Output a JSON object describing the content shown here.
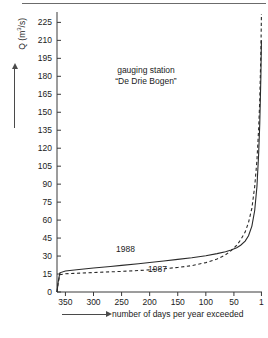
{
  "annotation": {
    "line1": "gauging station",
    "line2": "“De Drie Bogen”"
  },
  "axes": {
    "y_title_prefix": "Q (m",
    "y_title_exp": "3",
    "y_title_suffix": "/s)",
    "x_caption": "number of days per year exceeded"
  },
  "chart_data": {
    "type": "line",
    "title": "",
    "subtitle": "",
    "xlabel": "number of days per year exceeded",
    "ylabel": "Q (m3/s)",
    "xlim": [
      365,
      0
    ],
    "ylim": [
      0,
      232
    ],
    "x_ticks": [
      350,
      300,
      250,
      200,
      150,
      100,
      50,
      1
    ],
    "y_ticks": [
      0,
      15,
      30,
      45,
      60,
      75,
      90,
      105,
      120,
      135,
      150,
      165,
      180,
      195,
      210,
      225
    ],
    "x_reversed": true,
    "grid": false,
    "legend": "inline-labels",
    "annotations": [
      {
        "text": "gauging station",
        "x": 200,
        "y": 190
      },
      {
        "text": "“De Drie Bogen”",
        "x": 200,
        "y": 182
      },
      {
        "text": "1988",
        "x": 175,
        "y": 37
      },
      {
        "text": "1987",
        "x": 130,
        "y": 22
      }
    ],
    "series": [
      {
        "name": "1988",
        "style": "solid",
        "x": [
          365,
          363,
          360,
          350,
          330,
          300,
          270,
          250,
          220,
          200,
          175,
          150,
          125,
          100,
          80,
          65,
          55,
          45,
          38,
          30,
          24,
          18,
          13,
          9,
          6,
          4,
          2,
          1
        ],
        "values": [
          0,
          8,
          16,
          17.5,
          18.6,
          20.0,
          21.3,
          22.2,
          23.6,
          24.6,
          25.9,
          27.2,
          28.6,
          30.3,
          32.0,
          33.6,
          35.0,
          37.0,
          39.0,
          42.5,
          47.0,
          55.0,
          68.0,
          88.0,
          115.0,
          140.0,
          180.0,
          210.0
        ]
      },
      {
        "name": "1987",
        "style": "dashed",
        "x": [
          365,
          363,
          360,
          350,
          330,
          300,
          270,
          250,
          220,
          200,
          175,
          150,
          125,
          100,
          80,
          65,
          55,
          45,
          38,
          30,
          24,
          18,
          13,
          9,
          6,
          4,
          2,
          1
        ],
        "values": [
          0,
          7,
          14.5,
          15.2,
          15.6,
          16.2,
          16.8,
          17.2,
          17.9,
          18.5,
          19.4,
          20.5,
          22.0,
          24.5,
          27.5,
          31.0,
          34.5,
          39.0,
          43.5,
          50.0,
          58.0,
          70.0,
          88.0,
          110.0,
          136.0,
          160.0,
          200.0,
          232.0
        ]
      }
    ]
  }
}
